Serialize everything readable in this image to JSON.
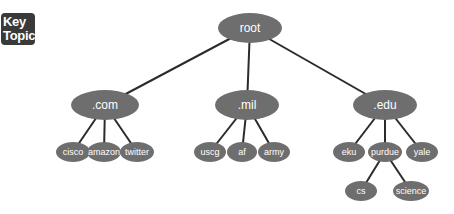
{
  "badge": {
    "line1": "Key",
    "line2": "Topic"
  },
  "colors": {
    "node_fill": "#6e6e6e",
    "edge": "#2b2b2b",
    "label": "#ffffff"
  },
  "tree": {
    "root": {
      "label": "root",
      "x": 250,
      "y": 28,
      "rx": 32,
      "ry": 15,
      "fs": 12
    },
    "tlds": [
      {
        "label": ".com",
        "x": 105,
        "y": 105,
        "rx": 34,
        "ry": 15,
        "fs": 12
      },
      {
        "label": ".mil",
        "x": 247,
        "y": 105,
        "rx": 32,
        "ry": 15,
        "fs": 12
      },
      {
        "label": ".edu",
        "x": 385,
        "y": 105,
        "rx": 32,
        "ry": 15,
        "fs": 12
      }
    ],
    "leaves": [
      {
        "label": "cisco",
        "x": 73,
        "y": 152,
        "rx": 17,
        "ry": 10,
        "fs": 9,
        "parent": 0
      },
      {
        "label": "amazon",
        "x": 104,
        "y": 152,
        "rx": 17,
        "ry": 10,
        "fs": 9,
        "parent": 0
      },
      {
        "label": "twitter",
        "x": 137,
        "y": 152,
        "rx": 17,
        "ry": 10,
        "fs": 9,
        "parent": 0
      },
      {
        "label": "uscg",
        "x": 210,
        "y": 152,
        "rx": 16,
        "ry": 10,
        "fs": 9,
        "parent": 1
      },
      {
        "label": "af",
        "x": 242,
        "y": 152,
        "rx": 15,
        "ry": 10,
        "fs": 9,
        "parent": 1
      },
      {
        "label": "army",
        "x": 274,
        "y": 152,
        "rx": 16,
        "ry": 10,
        "fs": 9,
        "parent": 1
      },
      {
        "label": "eku",
        "x": 349,
        "y": 152,
        "rx": 16,
        "ry": 10,
        "fs": 9,
        "parent": 2
      },
      {
        "label": "purdue",
        "x": 385,
        "y": 152,
        "rx": 17,
        "ry": 10,
        "fs": 9,
        "parent": 2
      },
      {
        "label": "yale",
        "x": 422,
        "y": 152,
        "rx": 16,
        "ry": 10,
        "fs": 9,
        "parent": 2
      }
    ],
    "subleaves": [
      {
        "label": "cs",
        "x": 361,
        "y": 191,
        "rx": 16,
        "ry": 10,
        "fs": 9,
        "parent": 7
      },
      {
        "label": "science",
        "x": 411,
        "y": 191,
        "rx": 18,
        "ry": 10,
        "fs": 9,
        "parent": 7
      }
    ]
  }
}
